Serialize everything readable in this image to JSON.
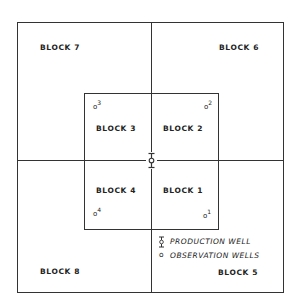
{
  "diagram": {
    "blocks": [
      {
        "id": 1,
        "label": "BLOCK 1"
      },
      {
        "id": 2,
        "label": "BLOCK 2"
      },
      {
        "id": 3,
        "label": "BLOCK 3"
      },
      {
        "id": 4,
        "label": "BLOCK 4"
      },
      {
        "id": 5,
        "label": "BLOCK 5"
      },
      {
        "id": 6,
        "label": "BLOCK 6"
      },
      {
        "id": 7,
        "label": "BLOCK 7"
      },
      {
        "id": 8,
        "label": "BLOCK 8"
      }
    ],
    "observation_wells": [
      {
        "id": "1",
        "symbol": "o",
        "number": "1"
      },
      {
        "id": "2",
        "symbol": "o",
        "number": "2"
      },
      {
        "id": "3",
        "symbol": "o",
        "number": "3"
      },
      {
        "id": "4",
        "symbol": "o",
        "number": "4"
      }
    ],
    "legend": {
      "production_well": "PRODUCTION WELL",
      "observation_wells": "OBSERVATION WELLS",
      "observation_symbol": "o"
    },
    "colors": {
      "line": "#333333",
      "background": "#ffffff"
    }
  }
}
